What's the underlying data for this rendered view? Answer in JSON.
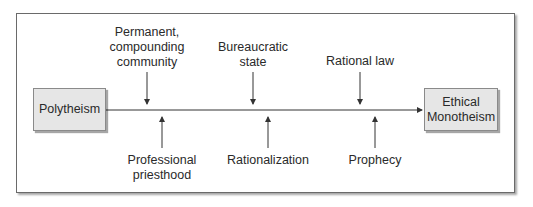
{
  "diagram": {
    "start_node": "Polytheism",
    "end_node": "Ethical\nMonotheism",
    "top_factors": [
      {
        "label": "Permanent,\ncompounding\ncommunity",
        "x": 147
      },
      {
        "label": "Bureaucratic\nstate",
        "x": 253
      },
      {
        "label": "Rational law",
        "x": 360
      }
    ],
    "bottom_factors": [
      {
        "label": "Professional\npriesthood",
        "x": 162
      },
      {
        "label": "Rationalization",
        "x": 268
      },
      {
        "label": "Prophecy",
        "x": 375
      }
    ],
    "colors": {
      "box_fill": "#e6e6e6",
      "line": "#333333",
      "frame": "#6a6a6a"
    }
  }
}
